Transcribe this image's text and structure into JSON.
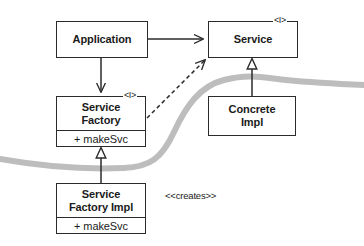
{
  "diagram": {
    "stereotype_interface": "<I>",
    "boundary_curve_color": "#bdbdbd",
    "line_color": "#2b2b2b",
    "background": "#ffffff",
    "classes": [
      {
        "id": "application",
        "name": "Application",
        "name_line1": "Application",
        "name_line2": "",
        "is_interface": false,
        "operations": []
      },
      {
        "id": "service",
        "name": "Service",
        "name_line1": "Service",
        "name_line2": "",
        "is_interface": true,
        "interface_marker": "<I>",
        "operations": []
      },
      {
        "id": "service-factory",
        "name": "Service Factory",
        "name_line1": "Service",
        "name_line2": "Factory",
        "is_interface": true,
        "interface_marker": "<I>",
        "operations": [
          "+ makeSvc"
        ],
        "operation_1": "+ makeSvc"
      },
      {
        "id": "concrete-impl",
        "name": "Concrete Impl",
        "name_line1": "Concrete",
        "name_line2": "Impl",
        "is_interface": false,
        "operations": []
      },
      {
        "id": "service-factory-impl",
        "name": "Service Factory Impl",
        "name_line1": "Service",
        "name_line2": "Factory Impl",
        "is_interface": false,
        "operations": [
          "+ makeSvc"
        ],
        "operation_1": "+ makeSvc"
      }
    ],
    "relationships": [
      {
        "id": "app-uses-service",
        "from": "application",
        "to": "service",
        "type": "association",
        "arrowhead": "open",
        "style": "solid",
        "label": ""
      },
      {
        "id": "app-uses-factory",
        "from": "application",
        "to": "service-factory",
        "type": "association",
        "arrowhead": "open",
        "style": "solid",
        "label": ""
      },
      {
        "id": "factory-dependency-service",
        "from": "service-factory",
        "to": "service",
        "type": "dependency",
        "arrowhead": "open",
        "style": "dashed",
        "label": ""
      },
      {
        "id": "concrete-realizes-service",
        "from": "concrete-impl",
        "to": "service",
        "type": "generalization",
        "arrowhead": "hollow-triangle",
        "style": "solid",
        "label": ""
      },
      {
        "id": "impl-realizes-factory",
        "from": "service-factory-impl",
        "to": "service-factory",
        "type": "generalization",
        "arrowhead": "hollow-triangle",
        "style": "solid",
        "label": ""
      },
      {
        "id": "impl-creates-concrete",
        "from": "service-factory-impl",
        "to": "concrete-impl",
        "type": "dependency",
        "arrowhead": "open",
        "style": "solid",
        "label": "<<creates>>"
      }
    ],
    "labels": {
      "creates": "<<creates>>"
    }
  }
}
